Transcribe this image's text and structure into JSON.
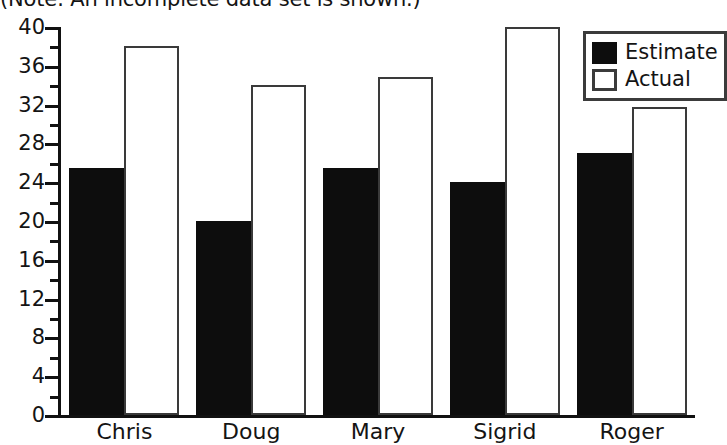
{
  "caption": "(Note: An incomplete data set is shown.)",
  "legend": {
    "position": "top-right",
    "entries": [
      {
        "label": "Estimate",
        "swatch": "filled-black"
      },
      {
        "label": "Actual",
        "swatch": "outlined-white"
      }
    ]
  },
  "chart_data": {
    "type": "bar",
    "title": "",
    "subtitle": "(Note: An incomplete data set is shown.)",
    "xlabel": "",
    "ylabel": "",
    "ylim": [
      0,
      40
    ],
    "y_major_tick_step": 4,
    "y_minor_tick_step": 2,
    "ytick_labels": [
      "0",
      "4",
      "8",
      "12",
      "16",
      "20",
      "24",
      "28",
      "32",
      "36",
      "40"
    ],
    "ytick_values": [
      0,
      4,
      8,
      12,
      16,
      20,
      24,
      28,
      32,
      36,
      40
    ],
    "grid": false,
    "legend_position": "top-right",
    "categories": [
      "Chris",
      "Doug",
      "Mary",
      "Sigrid",
      "Roger"
    ],
    "series": [
      {
        "name": "Estimate",
        "color": "#0d0d0d",
        "style": "filled",
        "values": [
          25.5,
          20,
          25.5,
          24,
          27
        ]
      },
      {
        "name": "Actual",
        "color": "#ffffff",
        "style": "outlined",
        "values": [
          38,
          34,
          34.8,
          40,
          31.8
        ]
      }
    ]
  }
}
